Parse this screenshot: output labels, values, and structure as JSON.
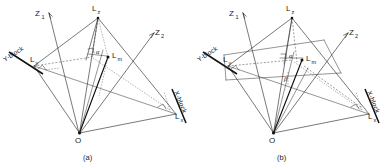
{
  "figure": {
    "background_color": "#ffffff",
    "ink_color": "#1a1a1a",
    "width": 387,
    "height": 168,
    "panel_count": 2
  },
  "panels": [
    {
      "id": "panel-a",
      "caption": "(a)",
      "origin_label": "O",
      "axes": [
        {
          "name": "Z1",
          "base": "Z",
          "subscript": "1"
        },
        {
          "name": "Z2",
          "base": "Z",
          "subscript": "2"
        }
      ],
      "points": [
        {
          "name": "Lz",
          "base": "L",
          "subscript": "z",
          "role": "apex-vertical"
        },
        {
          "name": "Lm",
          "base": "L",
          "subscript": "m",
          "role": "interior-marker"
        },
        {
          "name": "Ly",
          "base": "L",
          "subscript": "y",
          "role": "y-block-foot"
        },
        {
          "name": "Lx",
          "base": "L",
          "subscript": "x",
          "role": "x-block-foot"
        }
      ],
      "blocks": [
        {
          "label": "Y-block",
          "side": "left"
        },
        {
          "label": "X-block",
          "side": "right"
        }
      ],
      "angles": [
        {
          "symbol": "α",
          "near": "Lz"
        }
      ],
      "right_angle_marks": 3
    },
    {
      "id": "panel-b",
      "caption": "(b)",
      "origin_label": "O",
      "axes": [
        {
          "name": "Z1",
          "base": "Z",
          "subscript": "1"
        },
        {
          "name": "Z2",
          "base": "Z",
          "subscript": "2"
        }
      ],
      "points": [
        {
          "name": "Lz",
          "base": "L",
          "subscript": "z",
          "role": "apex-vertical"
        },
        {
          "name": "Lm",
          "base": "L",
          "subscript": "m",
          "role": "interior-marker"
        },
        {
          "name": "Ly",
          "base": "L",
          "subscript": "y",
          "role": "y-block-foot"
        },
        {
          "name": "Lx",
          "base": "L",
          "subscript": "x",
          "role": "x-block-foot"
        }
      ],
      "blocks": [
        {
          "label": "Y-block",
          "side": "left"
        },
        {
          "label": "X-block",
          "side": "right"
        }
      ],
      "angles": [
        {
          "symbol": "α",
          "near": "Lm"
        },
        {
          "symbol": "β",
          "near": "interior-lower"
        }
      ],
      "right_angle_marks": 2
    }
  ]
}
